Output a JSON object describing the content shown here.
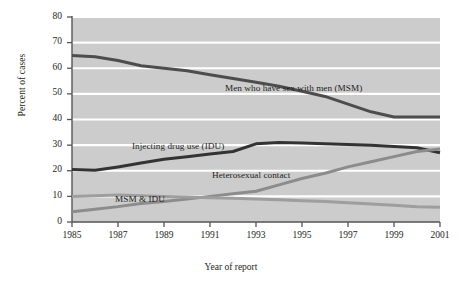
{
  "chart_data": {
    "type": "line",
    "title": "",
    "xlabel": "Year of report",
    "ylabel": "Percent of cases",
    "xlim": [
      1985,
      2001
    ],
    "ylim": [
      0,
      80
    ],
    "yticks": [
      0,
      10,
      20,
      30,
      40,
      50,
      60,
      70,
      80
    ],
    "xticks": [
      1985,
      1987,
      1989,
      1991,
      1993,
      1995,
      1997,
      1999,
      2001
    ],
    "xtick_labels": [
      "1985",
      "1987",
      "1989",
      "1991",
      "1993",
      "1995",
      "1997",
      "1999",
      "2001"
    ],
    "ytick_labels": [
      "0",
      "10",
      "20",
      "30",
      "40",
      "50",
      "60",
      "70",
      "80"
    ],
    "grid": "horizontal-white-on-gray",
    "plot_bgcolor": "#cccccc",
    "gridline_color": "#ffffff",
    "legend": "inline-annotations",
    "x": [
      1985,
      1986,
      1987,
      1988,
      1989,
      1990,
      1991,
      1992,
      1993,
      1994,
      1995,
      1996,
      1997,
      1998,
      1999,
      2000,
      2001
    ],
    "series": [
      {
        "name": "Men who have sex with men (MSM)",
        "color": "#4d4d4d",
        "width": 3.0,
        "values": [
          65,
          64.5,
          63,
          61,
          60,
          59,
          57.5,
          56,
          54.5,
          53,
          51,
          49,
          46,
          43,
          41,
          41,
          41
        ],
        "label_x": 1991.2,
        "label_y": 51.5
      },
      {
        "name": "Injecting drug use (IDU)",
        "color": "#333333",
        "width": 3.0,
        "values": [
          20.5,
          20.2,
          21.5,
          23,
          24.5,
          25.5,
          26.5,
          27.5,
          30.5,
          31,
          30.8,
          30.5,
          30.2,
          30,
          29.5,
          29,
          27
        ],
        "label_x": 1988.3,
        "label_y": 33.8
      },
      {
        "name": "Heterosexual contact",
        "color": "#8c8c8c",
        "width": 3.0,
        "values": [
          4,
          5,
          6,
          7.2,
          8,
          9,
          10,
          11,
          12,
          14.5,
          17,
          19,
          21.5,
          23.5,
          25.5,
          27.5,
          28.5
        ],
        "label_x": 1991.1,
        "label_y": 21.5
      },
      {
        "name": "MSM & IDU",
        "color": "#9e9e9e",
        "width": 3.0,
        "values": [
          10,
          10.2,
          10.5,
          10.2,
          10,
          9.8,
          9.5,
          9.3,
          9,
          8.7,
          8.3,
          8,
          7.5,
          7,
          6.5,
          6,
          5.8
        ],
        "label_x": 1987.1,
        "label_y": 12.8
      }
    ],
    "annotations": [
      {
        "text": "Men who have sex with men (MSM)",
        "x": 225,
        "y": 83
      },
      {
        "text": "Injecting drug use (IDU)",
        "x": 132,
        "y": 141
      },
      {
        "text": "Heterosexual contact",
        "x": 212,
        "y": 170
      },
      {
        "text": "MSM & IDU",
        "x": 115,
        "y": 194
      }
    ]
  },
  "axes": {
    "y_title": "Percent of cases",
    "x_title": "Year of report"
  }
}
